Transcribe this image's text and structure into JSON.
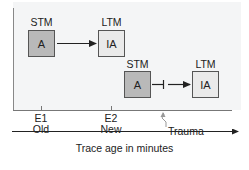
{
  "diagram": {
    "type": "memory consolidation timeline",
    "row1": {
      "left_box": {
        "header": "STM",
        "label": "A",
        "fill": "#b9b9b9"
      },
      "right_box": {
        "header": "LTM",
        "label": "IA",
        "fill": "#eaeaea"
      },
      "connector": "arrow"
    },
    "row2": {
      "left_box": {
        "header": "STM",
        "label": "A",
        "fill": "#b9b9b9"
      },
      "right_box": {
        "header": "LTM",
        "label": "IA",
        "fill": "#eaeaea"
      },
      "connector": "blocked-arrow"
    },
    "ticks": [
      {
        "line1": "E1",
        "line2": "Old"
      },
      {
        "line1": "E2",
        "line2": "New"
      }
    ],
    "event": {
      "label": "Trauma"
    },
    "x_axis": {
      "label": "Trace age in minutes"
    },
    "colors": {
      "panel": "#f4f5f6",
      "line": "#333333",
      "axis_gray": "#888888"
    }
  }
}
